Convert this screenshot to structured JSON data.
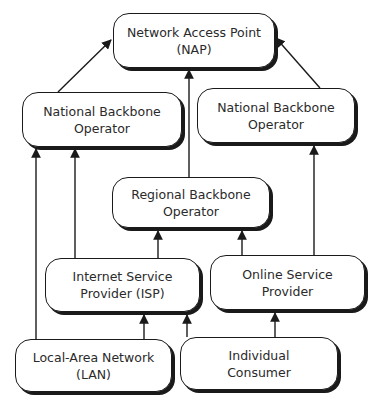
{
  "diagram": {
    "type": "hierarchy",
    "nodes": {
      "nap": {
        "line1": "Network Access Point",
        "line2": "(NAP)"
      },
      "nbo_left": {
        "line1": "National Backbone",
        "line2": "Operator"
      },
      "nbo_right": {
        "line1": "National Backbone",
        "line2": "Operator"
      },
      "regional": {
        "line1": "Regional Backbone",
        "line2": "Operator"
      },
      "isp": {
        "line1": "Internet Service",
        "line2": "Provider (ISP)"
      },
      "osp": {
        "line1": "Online Service",
        "line2": "Provider"
      },
      "lan": {
        "line1": "Local-Area Network",
        "line2": "(LAN)"
      },
      "consumer": {
        "line1": "Individual",
        "line2": "Consumer"
      }
    },
    "edges": [
      {
        "from": "nbo_left",
        "to": "nap"
      },
      {
        "from": "nbo_right",
        "to": "nap"
      },
      {
        "from": "regional",
        "to": "nap"
      },
      {
        "from": "lan",
        "to": "nbo_left"
      },
      {
        "from": "isp",
        "to": "nbo_left"
      },
      {
        "from": "isp",
        "to": "regional"
      },
      {
        "from": "osp",
        "to": "regional"
      },
      {
        "from": "osp",
        "to": "nbo_right"
      },
      {
        "from": "lan",
        "to": "isp"
      },
      {
        "from": "consumer",
        "to": "isp"
      },
      {
        "from": "consumer",
        "to": "osp"
      }
    ],
    "colors": {
      "stroke": "#1a1a1a",
      "text": "#2a2a2a",
      "background": "#ffffff"
    }
  }
}
